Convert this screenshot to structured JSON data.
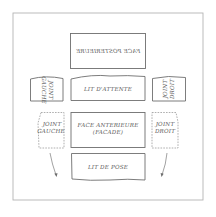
{
  "diagram": {
    "title": "",
    "faces": {
      "face_posterieure": {
        "label": "FACE POSTERIEURE",
        "mirrored": true
      },
      "lit_attente": {
        "label": "LIT D'ATTENTE"
      },
      "joint_gauche_top": {
        "line1": "JOINT",
        "line2": "GAUCHE",
        "rotated": true
      },
      "joint_droit_top": {
        "line1": "JOINT",
        "line2": "DROIT",
        "rotated": true
      },
      "joint_gauche": {
        "line1": "JOINT",
        "line2": "GAUCHE",
        "style": "dashed"
      },
      "face_anterieure": {
        "line1": "FACE ANTERIEURE",
        "line2": "(FACADE)"
      },
      "joint_droit": {
        "line1": "JOINT",
        "line2": "DROIT",
        "style": "dashed"
      },
      "lit_de_pose": {
        "label": "LIT DE POSE"
      }
    },
    "arrows": [
      {
        "from": "joint_gauche",
        "direction": "down-right"
      },
      {
        "from": "joint_droit",
        "direction": "down-left"
      }
    ],
    "colors": {
      "stroke": "#6e6e6e",
      "frame": "#b4b4b4",
      "text": "#5a5a5a",
      "background": "#ffffff"
    }
  }
}
